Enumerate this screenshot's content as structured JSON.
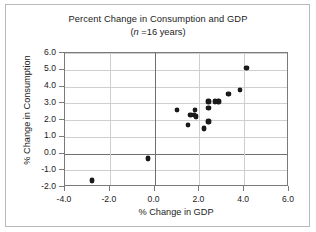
{
  "chart_data": {
    "type": "scatter",
    "title": "Percent Change in Consumption and GDP",
    "subtitle_prefix": "(",
    "subtitle_italic": "n",
    "subtitle_suffix": " =16 years)",
    "subtitle_full": "(n =16 years)",
    "xlabel": "% Change in GDP",
    "ylabel": "% Change in Consumption",
    "xlim": [
      -4.0,
      6.0
    ],
    "ylim": [
      -2.0,
      6.0
    ],
    "xticks": [
      "-4.0",
      "-2.0",
      "0.0",
      "2.0",
      "4.0",
      "6.0"
    ],
    "xtick_values": [
      -4.0,
      -2.0,
      0.0,
      2.0,
      4.0,
      6.0
    ],
    "yticks": [
      "6.0",
      "5.0",
      "4.0",
      "3.0",
      "2.0",
      "1.0",
      "0.0",
      "-1.0",
      "-2.0"
    ],
    "ytick_values": [
      6.0,
      5.0,
      4.0,
      3.0,
      2.0,
      1.0,
      0.0,
      -1.0,
      -2.0
    ],
    "grid": true,
    "legend": false,
    "n": 16,
    "marker": "filled-diamond",
    "marker_color": "#1a1a1a",
    "grid_color": "#cfcfcf",
    "axis_color": "#7a7a7a",
    "points": [
      {
        "x": -2.8,
        "y": -1.6
      },
      {
        "x": -0.3,
        "y": -0.3
      },
      {
        "x": 1.0,
        "y": 2.6
      },
      {
        "x": 1.5,
        "y": 1.7
      },
      {
        "x": 1.6,
        "y": 2.3
      },
      {
        "x": 1.75,
        "y": 2.3
      },
      {
        "x": 1.8,
        "y": 2.6
      },
      {
        "x": 1.85,
        "y": 2.2
      },
      {
        "x": 2.2,
        "y": 1.5
      },
      {
        "x": 2.4,
        "y": 1.9
      },
      {
        "x": 2.4,
        "y": 2.7
      },
      {
        "x": 2.4,
        "y": 3.1
      },
      {
        "x": 2.7,
        "y": 3.1
      },
      {
        "x": 2.85,
        "y": 3.1
      },
      {
        "x": 3.3,
        "y": 3.55
      },
      {
        "x": 3.8,
        "y": 3.8
      },
      {
        "x": 4.1,
        "y": 5.1
      }
    ]
  }
}
